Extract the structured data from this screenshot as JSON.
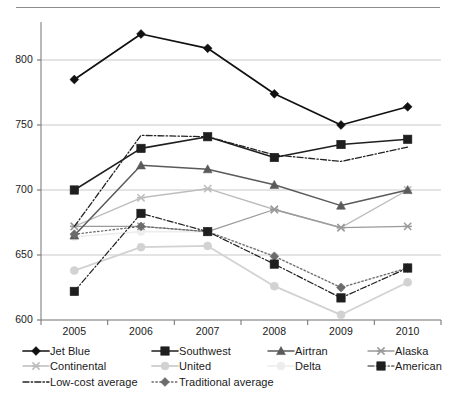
{
  "figure": {
    "has_top_rule": true
  },
  "chart_data": {
    "type": "line",
    "title": "",
    "subtitle": "",
    "xlabel": "",
    "ylabel": "",
    "grid": true,
    "legend_position": "bottom",
    "categories": [
      "2005",
      "2006",
      "2007",
      "2008",
      "2009",
      "2010"
    ],
    "yticks": [
      600,
      650,
      700,
      750,
      800
    ],
    "ylim": [
      600,
      830
    ],
    "series": [
      {
        "name": "Jet Blue",
        "values": [
          785,
          820,
          809,
          774,
          750,
          764
        ],
        "color": "#111111",
        "marker": "diamond",
        "line": "solid",
        "width": 1.7
      },
      {
        "name": "Southwest",
        "values": [
          700,
          732,
          741,
          725,
          735,
          739
        ],
        "color": "#1f1f1f",
        "marker": "square",
        "line": "solid",
        "width": 1.6
      },
      {
        "name": "Airtran",
        "values": [
          665,
          719,
          716,
          704,
          688,
          700
        ],
        "color": "#5a5a5a",
        "marker": "triangle",
        "line": "solid",
        "width": 1.5
      },
      {
        "name": "Alaska",
        "values": [
          672,
          672,
          668,
          685,
          671,
          672
        ],
        "color": "#9a9a9a",
        "marker": "x",
        "line": "solid",
        "width": 1.3
      },
      {
        "name": "Continental",
        "values": [
          672,
          694,
          701,
          685,
          671,
          700
        ],
        "color": "#bdbdbd",
        "marker": "x",
        "line": "solid",
        "width": 1.4
      },
      {
        "name": "United",
        "values": [
          638,
          656,
          657,
          626,
          604,
          629
        ],
        "color": "#d2d2d2",
        "marker": "circle",
        "line": "solid",
        "width": 1.8
      },
      {
        "name": "Delta",
        "values": [
          664,
          668,
          668,
          649,
          625,
          640
        ],
        "color": "#ededed",
        "marker": "circle",
        "line": "solid",
        "width": 1.6
      },
      {
        "name": "American",
        "values": [
          622,
          682,
          668,
          643,
          617,
          640
        ],
        "color": "#1f1f1f",
        "marker": "square",
        "line": "dashdot",
        "width": 1.2
      },
      {
        "name": "Low-cost average",
        "values": [
          672,
          742,
          741,
          727,
          722,
          733
        ],
        "color": "#232323",
        "marker": "none",
        "line": "dashdot",
        "width": 1.3
      },
      {
        "name": "Traditional average",
        "values": [
          666,
          672,
          668,
          649,
          625,
          640
        ],
        "color": "#6b6b6b",
        "marker": "diamond",
        "line": "dotted",
        "width": 1.3
      }
    ]
  },
  "legend": {
    "rows": [
      [
        {
          "label": "Jet Blue",
          "series": 0
        },
        {
          "label": "Southwest",
          "series": 1
        },
        {
          "label": "Airtran",
          "series": 2
        },
        {
          "label": "Alaska",
          "series": 3
        }
      ],
      [
        {
          "label": "Continental",
          "series": 4
        },
        {
          "label": "United",
          "series": 5
        },
        {
          "label": "Delta",
          "series": 6
        },
        {
          "label": "American",
          "series": 7
        }
      ],
      [
        {
          "label": "Low-cost average",
          "series": 8
        },
        {
          "label": "Traditional average",
          "series": 9
        }
      ]
    ]
  }
}
